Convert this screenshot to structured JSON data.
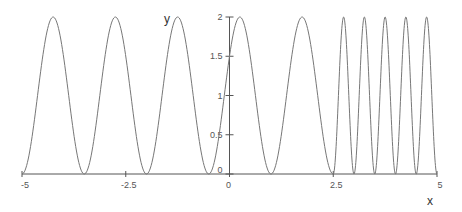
{
  "chart_data": {
    "type": "line",
    "title": "",
    "xlabel": "x",
    "ylabel": "y",
    "xlim": [
      -5,
      5
    ],
    "ylim": [
      0,
      2
    ],
    "grid": false,
    "legend": null,
    "x_ticks": [
      {
        "value": -5,
        "label": "-5"
      },
      {
        "value": -2.5,
        "label": "-2.5"
      },
      {
        "value": 0,
        "label": "0"
      },
      {
        "value": 2.5,
        "label": "2.5"
      },
      {
        "value": 5,
        "label": "5"
      }
    ],
    "y_ticks": [
      {
        "value": 0,
        "label": "0"
      },
      {
        "value": 0.5,
        "label": "0.5"
      },
      {
        "value": 1,
        "label": "1"
      },
      {
        "value": 1.5,
        "label": "1.5"
      },
      {
        "value": 2,
        "label": "2"
      }
    ],
    "series": [
      {
        "name": "piecewise periodic function",
        "description": "y = 1 - cos(2*pi*(x+5)/1.5) for -5 <= x <= 2.5 (period 1.5); y = 1 - cos(2*pi*(x-2.5)/0.5) for 2.5 <= x <= 5 (period 0.5)",
        "segments": [
          {
            "x_from": -5,
            "x_to": 2.5,
            "period": 1.5,
            "phase_origin": -5
          },
          {
            "x_from": 2.5,
            "x_to": 5,
            "period": 0.5,
            "phase_origin": 2.5
          }
        ],
        "peaks_x": [
          -4.25,
          -2.75,
          -1.25,
          0.25,
          1.75,
          2.75,
          3.25,
          3.75,
          4.25,
          4.75
        ],
        "minima_x": [
          -5,
          -3.5,
          -2,
          -0.5,
          1,
          2.5,
          3,
          3.5,
          4,
          4.5,
          5
        ],
        "peak_value": 2,
        "min_value": 0,
        "color": "#777777"
      }
    ]
  },
  "style": {
    "axis_color": "#555555",
    "curve_color": "#777777"
  }
}
